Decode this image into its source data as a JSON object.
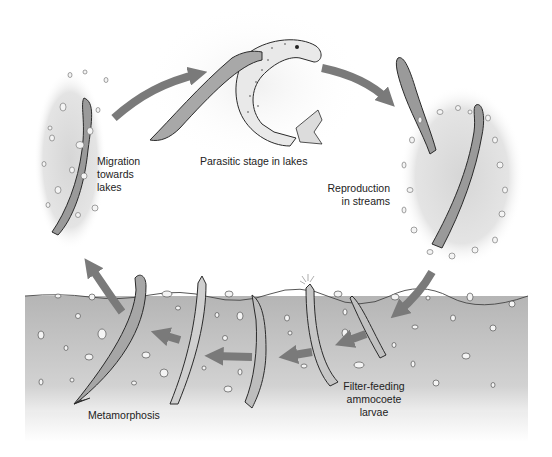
{
  "diagram": {
    "stages": [
      {
        "id": "migration",
        "label_lines": [
          "Migration",
          "towards",
          "lakes"
        ]
      },
      {
        "id": "parasitic",
        "label_lines": [
          "Parasitic stage in lakes"
        ]
      },
      {
        "id": "reproduction",
        "label_lines": [
          "Reproduction",
          "in streams"
        ]
      },
      {
        "id": "larvae",
        "label_lines": [
          "Filter-feeding",
          "ammocoete",
          "larvae"
        ]
      },
      {
        "id": "metamorphosis",
        "label_lines": [
          "Metamorphosis"
        ]
      }
    ],
    "flow": [
      "migration",
      "parasitic",
      "reproduction",
      "larvae",
      "metamorphosis",
      "migration"
    ],
    "colors": {
      "arrow": "#7a7a7a",
      "sediment_top": "#b9b9b9",
      "sediment_bottom": "#e6e6e6",
      "halo": "#dcdcdc",
      "lamprey_body": "#9a9a9a",
      "outline": "#2a2a2a",
      "pebble": "#f4f4f4"
    }
  }
}
